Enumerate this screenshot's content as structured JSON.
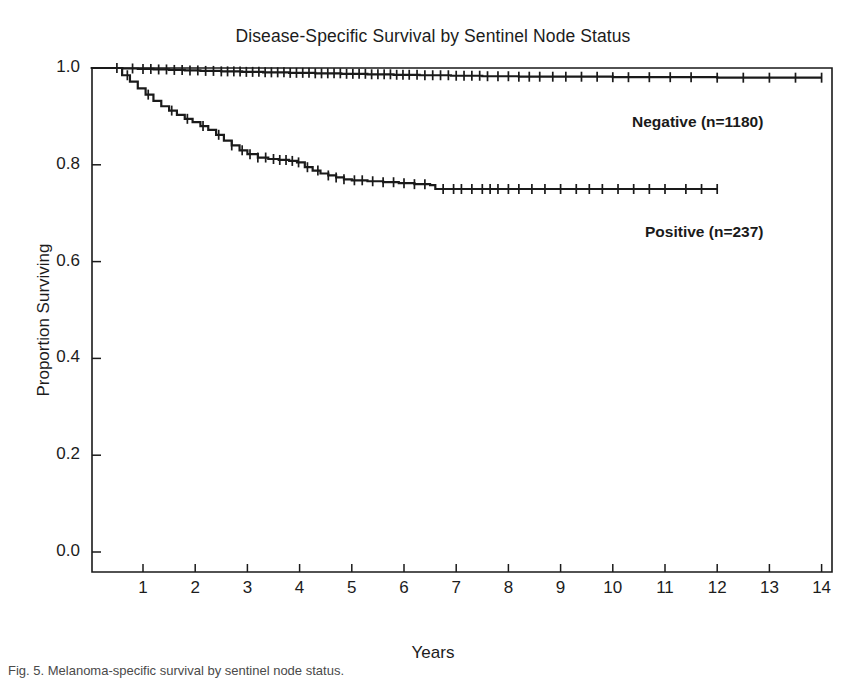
{
  "chart_data": {
    "type": "line",
    "title": "Disease-Specific Survival by Sentinel Node Status",
    "xlabel": "Years",
    "ylabel": "Proportion Surviving",
    "xlim": [
      0,
      14.6
    ],
    "ylim": [
      0.0,
      1.04
    ],
    "xticks": [
      1,
      2,
      3,
      4,
      5,
      6,
      7,
      8,
      9,
      10,
      11,
      12,
      13,
      14
    ],
    "xtick_labels": [
      "1",
      "2",
      "3",
      "4",
      "5",
      "6",
      "7",
      "8",
      "9",
      "10",
      "11",
      "12",
      "13",
      "14"
    ],
    "yticks": [
      0.0,
      0.2,
      0.4,
      0.6,
      0.8,
      1.0
    ],
    "ytick_labels": [
      "0.0",
      "0.2",
      "0.4",
      "0.6",
      "0.8",
      "1.0"
    ],
    "grid": false,
    "legend_position": "inline-right-annotations",
    "line_color": "#1a1a1a",
    "series": [
      {
        "name": "Negative (n=1180)",
        "label": "Negative (n=1180)",
        "n": 1180,
        "status": "Negative",
        "points": [
          [
            0.0,
            1.0
          ],
          [
            0.4,
            1.0
          ],
          [
            0.6,
            0.999
          ],
          [
            0.9,
            0.998
          ],
          [
            1.2,
            0.997
          ],
          [
            1.5,
            0.996
          ],
          [
            1.8,
            0.995
          ],
          [
            2.1,
            0.994
          ],
          [
            2.5,
            0.993
          ],
          [
            2.9,
            0.992
          ],
          [
            3.3,
            0.991
          ],
          [
            3.8,
            0.99
          ],
          [
            4.3,
            0.989
          ],
          [
            4.8,
            0.988
          ],
          [
            5.3,
            0.987
          ],
          [
            5.8,
            0.986
          ],
          [
            6.3,
            0.985
          ],
          [
            6.9,
            0.984
          ],
          [
            7.5,
            0.983
          ],
          [
            8.2,
            0.982
          ],
          [
            9.0,
            0.982
          ],
          [
            10.0,
            0.981
          ],
          [
            11.0,
            0.981
          ],
          [
            12.0,
            0.98
          ],
          [
            13.0,
            0.98
          ],
          [
            14.0,
            0.98
          ]
        ],
        "censor_times": [
          0.5,
          0.8,
          1.0,
          1.15,
          1.3,
          1.45,
          1.6,
          1.75,
          1.9,
          2.05,
          2.2,
          2.35,
          2.5,
          2.62,
          2.74,
          2.86,
          2.98,
          3.1,
          3.22,
          3.34,
          3.46,
          3.58,
          3.7,
          3.82,
          3.94,
          4.06,
          4.18,
          4.3,
          4.42,
          4.54,
          4.66,
          4.78,
          4.9,
          5.02,
          5.14,
          5.26,
          5.38,
          5.5,
          5.62,
          5.74,
          5.86,
          5.98,
          6.1,
          6.25,
          6.4,
          6.55,
          6.7,
          6.85,
          7.0,
          7.15,
          7.3,
          7.45,
          7.6,
          7.8,
          8.0,
          8.2,
          8.4,
          8.6,
          8.85,
          9.1,
          9.4,
          9.7,
          10.0,
          10.3,
          10.7,
          11.1,
          11.5,
          12.0,
          12.5,
          13.0,
          13.5,
          14.0
        ],
        "end_value": 0.98
      },
      {
        "name": "Positive (n=237)",
        "label": "Positive (n=237)",
        "n": 237,
        "status": "Positive",
        "points": [
          [
            0.0,
            1.0
          ],
          [
            0.45,
            1.0
          ],
          [
            0.6,
            0.985
          ],
          [
            0.75,
            0.972
          ],
          [
            0.9,
            0.958
          ],
          [
            1.05,
            0.945
          ],
          [
            1.2,
            0.932
          ],
          [
            1.35,
            0.921
          ],
          [
            1.5,
            0.912
          ],
          [
            1.65,
            0.903
          ],
          [
            1.8,
            0.895
          ],
          [
            1.95,
            0.888
          ],
          [
            2.1,
            0.88
          ],
          [
            2.25,
            0.872
          ],
          [
            2.4,
            0.862
          ],
          [
            2.55,
            0.85
          ],
          [
            2.7,
            0.84
          ],
          [
            2.85,
            0.83
          ],
          [
            3.0,
            0.822
          ],
          [
            3.2,
            0.815
          ],
          [
            3.4,
            0.812
          ],
          [
            3.6,
            0.81
          ],
          [
            3.8,
            0.808
          ],
          [
            3.95,
            0.805
          ],
          [
            4.1,
            0.795
          ],
          [
            4.25,
            0.788
          ],
          [
            4.4,
            0.782
          ],
          [
            4.55,
            0.778
          ],
          [
            4.7,
            0.774
          ],
          [
            4.85,
            0.77
          ],
          [
            5.0,
            0.768
          ],
          [
            5.3,
            0.766
          ],
          [
            5.6,
            0.764
          ],
          [
            5.9,
            0.762
          ],
          [
            6.2,
            0.76
          ],
          [
            6.5,
            0.758
          ],
          [
            6.6,
            0.75
          ],
          [
            7.0,
            0.75
          ],
          [
            8.0,
            0.75
          ],
          [
            9.0,
            0.75
          ],
          [
            10.0,
            0.75
          ],
          [
            11.0,
            0.75
          ],
          [
            12.0,
            0.75
          ]
        ],
        "censor_times": [
          0.7,
          1.1,
          1.55,
          1.85,
          2.15,
          2.45,
          2.7,
          2.9,
          3.05,
          3.2,
          3.35,
          3.5,
          3.62,
          3.74,
          3.86,
          3.98,
          4.15,
          4.35,
          4.55,
          4.7,
          4.85,
          5.05,
          5.2,
          5.4,
          5.6,
          5.8,
          6.0,
          6.2,
          6.4,
          6.75,
          6.95,
          7.1,
          7.3,
          7.5,
          7.65,
          7.8,
          8.0,
          8.2,
          8.45,
          8.7,
          9.0,
          9.3,
          9.55,
          9.8,
          10.1,
          10.4,
          10.7,
          11.0,
          11.4,
          11.7,
          12.0
        ],
        "end_value": 0.75
      }
    ],
    "annotations": [
      {
        "text": "Negative (n=1180)",
        "x": 10.4,
        "y": 0.9
      },
      {
        "text": "Positive (n=237)",
        "x": 10.6,
        "y": 0.67
      }
    ]
  },
  "caption": {
    "text": "Fig. 5. Melanoma-specific survival by sentinel node status.",
    "prefix": "Fig. 5."
  }
}
